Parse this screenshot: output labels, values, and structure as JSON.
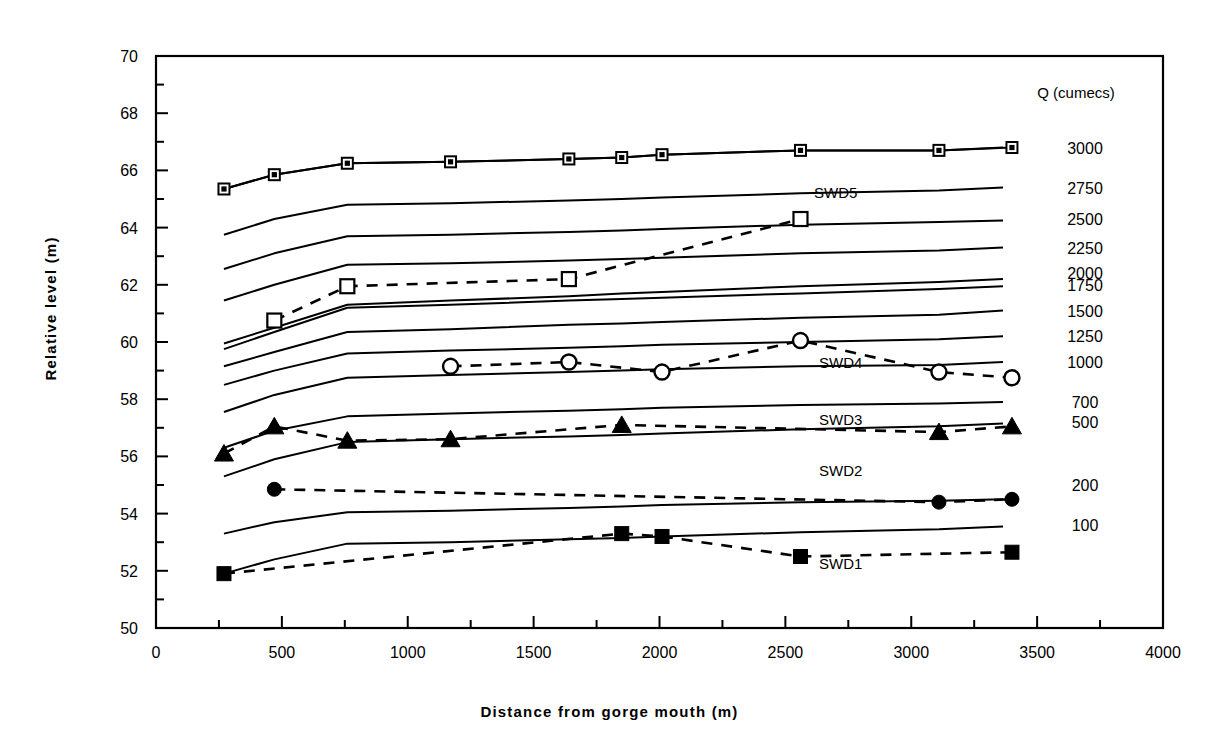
{
  "chart_data": {
    "type": "line",
    "title": "",
    "xlabel": "Distance from gorge mouth (m)",
    "ylabel": "Relative level  (m)",
    "xlim": [
      0,
      4000
    ],
    "ylim": [
      50,
      70
    ],
    "xticks": [
      0,
      500,
      1000,
      1500,
      2000,
      2500,
      3000,
      3500,
      4000
    ],
    "xtick_labels": [
      "0",
      "500",
      "1000",
      "1500",
      "2000",
      "2500",
      "3000",
      "3500",
      "4000"
    ],
    "yticks": [
      50,
      52,
      54,
      56,
      58,
      60,
      62,
      64,
      66,
      68,
      70
    ],
    "ytick_labels": [
      "50",
      "52",
      "54",
      "56",
      "58",
      "60",
      "62",
      "64",
      "66",
      "68",
      "70"
    ],
    "minor_ytick_step": 1,
    "minor_xtick_step": 250,
    "grid": false,
    "legend_position": "right",
    "legend_title": "Q (cumecs)",
    "legend_entries": [
      {
        "label": "3000",
        "y_value": 66.8
      },
      {
        "label": "2750",
        "y_value": 65.4
      },
      {
        "label": "2500",
        "y_value": 64.3
      },
      {
        "label": "2250",
        "y_value": 63.3
      },
      {
        "label": "2000",
        "y_value": 62.4
      },
      {
        "label": "1750",
        "y_value": 62.0
      },
      {
        "label": "1500",
        "y_value": 61.1
      },
      {
        "label": "1250",
        "y_value": 60.2
      },
      {
        "label": "1000",
        "y_value": 59.3
      },
      {
        "label": "700",
        "y_value": 57.9
      },
      {
        "label": "500",
        "y_value": 57.2
      },
      {
        "label": "200",
        "y_value": 55.0
      },
      {
        "label": "100",
        "y_value": 53.6
      }
    ],
    "series": [
      {
        "name": "Q3000",
        "style": "solid",
        "marker": "none",
        "x": [
          270,
          470,
          760,
          1170,
          1640,
          1850,
          2010,
          2560,
          3110,
          3400
        ],
        "y": [
          65.35,
          65.85,
          66.25,
          66.3,
          66.4,
          66.45,
          66.55,
          66.7,
          66.7,
          66.8
        ]
      },
      {
        "name": "Q2750",
        "style": "solid",
        "marker": "none",
        "x": [
          270,
          470,
          760,
          1170,
          1640,
          1850,
          2010,
          2560,
          3110,
          3400
        ],
        "y": [
          63.75,
          64.3,
          64.8,
          64.85,
          64.95,
          65.0,
          65.05,
          65.2,
          65.3,
          65.4
        ]
      },
      {
        "name": "Q2500",
        "style": "solid",
        "marker": "none",
        "x": [
          270,
          470,
          760,
          1170,
          1640,
          1850,
          2010,
          2560,
          3110,
          3400
        ],
        "y": [
          62.55,
          63.1,
          63.7,
          63.75,
          63.85,
          63.9,
          63.95,
          64.1,
          64.2,
          64.25
        ]
      },
      {
        "name": "Q2250",
        "style": "solid",
        "marker": "none",
        "x": [
          270,
          470,
          760,
          1170,
          1640,
          1850,
          2010,
          2560,
          3110,
          3400
        ],
        "y": [
          61.45,
          62.0,
          62.7,
          62.75,
          62.85,
          62.9,
          62.95,
          63.1,
          63.2,
          63.3
        ]
      },
      {
        "name": "Q2000",
        "style": "solid",
        "marker": "none",
        "x": [
          270,
          470,
          760,
          1170,
          1640,
          1850,
          2010,
          2560,
          3110,
          3400
        ],
        "y": [
          59.95,
          60.5,
          61.3,
          61.45,
          61.6,
          61.7,
          61.75,
          61.95,
          62.1,
          62.2
        ]
      },
      {
        "name": "Q1750",
        "style": "solid",
        "marker": "none",
        "x": [
          270,
          470,
          760,
          1170,
          1640,
          1850,
          2010,
          2560,
          3110,
          3400
        ],
        "y": [
          59.75,
          60.35,
          61.2,
          61.3,
          61.45,
          61.5,
          61.55,
          61.7,
          61.85,
          61.95
        ]
      },
      {
        "name": "Q1500",
        "style": "solid",
        "marker": "none",
        "x": [
          270,
          470,
          760,
          1170,
          1640,
          1850,
          2010,
          2560,
          3110,
          3400
        ],
        "y": [
          59.15,
          59.65,
          60.35,
          60.45,
          60.6,
          60.65,
          60.7,
          60.85,
          60.95,
          61.1
        ]
      },
      {
        "name": "Q1250",
        "style": "solid",
        "marker": "none",
        "x": [
          270,
          470,
          760,
          1170,
          1640,
          1850,
          2010,
          2560,
          3110,
          3400
        ],
        "y": [
          58.5,
          59.0,
          59.6,
          59.7,
          59.8,
          59.85,
          59.9,
          60.0,
          60.1,
          60.2
        ]
      },
      {
        "name": "Q1000",
        "style": "solid",
        "marker": "none",
        "x": [
          270,
          470,
          760,
          1170,
          1640,
          1850,
          2010,
          2560,
          3110,
          3400
        ],
        "y": [
          57.55,
          58.15,
          58.75,
          58.85,
          58.95,
          59.0,
          59.05,
          59.15,
          59.2,
          59.3
        ]
      },
      {
        "name": "Q700",
        "style": "solid",
        "marker": "none",
        "x": [
          270,
          470,
          760,
          1170,
          1640,
          1850,
          2010,
          2560,
          3110,
          3400
        ],
        "y": [
          56.3,
          56.9,
          57.4,
          57.5,
          57.6,
          57.65,
          57.7,
          57.8,
          57.85,
          57.9
        ]
      },
      {
        "name": "Q500",
        "style": "solid",
        "marker": "none",
        "x": [
          270,
          470,
          760,
          1170,
          1640,
          1850,
          2010,
          2560,
          3110,
          3400
        ],
        "y": [
          55.3,
          55.9,
          56.5,
          56.6,
          56.7,
          56.75,
          56.8,
          56.95,
          57.05,
          57.15
        ]
      },
      {
        "name": "Q200",
        "style": "solid",
        "marker": "none",
        "x": [
          270,
          470,
          760,
          1170,
          1640,
          1850,
          2010,
          2560,
          3110,
          3400
        ],
        "y": [
          53.3,
          53.7,
          54.05,
          54.1,
          54.2,
          54.25,
          54.3,
          54.4,
          54.45,
          54.5
        ]
      },
      {
        "name": "Q100",
        "style": "solid",
        "marker": "none",
        "x": [
          270,
          470,
          760,
          1170,
          1640,
          1850,
          2010,
          2560,
          3110,
          3400
        ],
        "y": [
          51.9,
          52.4,
          52.95,
          53.0,
          53.1,
          53.15,
          53.2,
          53.35,
          53.45,
          53.55
        ]
      },
      {
        "name": "3000",
        "style": "solid",
        "marker": "square-crossed",
        "x": [
          270,
          470,
          760,
          1170,
          1640,
          1850,
          2010,
          2560,
          3110,
          3400
        ],
        "y": [
          65.35,
          65.85,
          66.25,
          66.3,
          66.4,
          66.45,
          66.55,
          66.7,
          66.7,
          66.8
        ]
      },
      {
        "name": "SWD5",
        "style": "dashed",
        "marker": "open-square",
        "x": [
          470,
          760,
          1640,
          2560
        ],
        "y": [
          60.75,
          61.95,
          62.2,
          64.3
        ]
      },
      {
        "name": "SWD4",
        "style": "dashed",
        "marker": "open-circle",
        "x": [
          1170,
          1640,
          2010,
          2560,
          3110,
          3400
        ],
        "y": [
          59.15,
          59.3,
          58.95,
          60.05,
          58.95,
          58.75
        ]
      },
      {
        "name": "SWD3",
        "style": "dashed",
        "marker": "filled-triangle",
        "x": [
          270,
          470,
          760,
          1170,
          1850,
          3110,
          3400
        ],
        "y": [
          56.1,
          57.05,
          56.55,
          56.6,
          57.1,
          56.85,
          57.05
        ]
      },
      {
        "name": "SWD2",
        "style": "dashed",
        "marker": "filled-circle",
        "x": [
          470,
          3110,
          3400
        ],
        "y": [
          54.85,
          54.4,
          54.5
        ]
      },
      {
        "name": "SWD1",
        "style": "dashed",
        "marker": "filled-square",
        "x": [
          270,
          1850,
          2010,
          2560,
          3400
        ],
        "y": [
          51.9,
          53.3,
          53.2,
          52.5,
          52.65
        ]
      }
    ],
    "annotations": [
      {
        "text": "SWD5",
        "x": 2700,
        "y": 65.05
      },
      {
        "text": "SWD4",
        "x": 2720,
        "y": 59.1
      },
      {
        "text": "SWD3",
        "x": 2720,
        "y": 57.1
      },
      {
        "text": "SWD2",
        "x": 2720,
        "y": 55.3
      },
      {
        "text": "SWD1",
        "x": 2720,
        "y": 52.05
      }
    ]
  },
  "colors": {
    "line": "#000000",
    "background": "#ffffff",
    "text": "#000000"
  }
}
